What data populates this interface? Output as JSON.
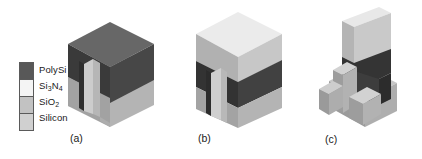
{
  "figure": {
    "background": "#ffffff"
  },
  "legend": {
    "name": "materials-legend",
    "items": [
      {
        "label": "PolySi",
        "color": "#585858",
        "symbol": "PolySi"
      },
      {
        "label": "Si3N4",
        "color": "#f4f4f4",
        "symbol": "Si",
        "sub1": "3",
        "mid": "N",
        "sub2": "4"
      },
      {
        "label": "SiO2",
        "color": "#c2c2c2",
        "symbol": "SiO",
        "sub1": "2"
      },
      {
        "label": "Silicon",
        "color": "#d0d0d0",
        "symbol": "Silicon"
      }
    ]
  },
  "panels": [
    {
      "id": "a",
      "caption": "(a)",
      "description": "PolySi block over silicon substrate with etched trench notch",
      "layers": [
        "Silicon",
        "PolySi"
      ]
    },
    {
      "id": "b",
      "caption": "(b)",
      "description": "Si3N4 / SiO2 cap layer deposited over PolySi and silicon substrate",
      "layers": [
        "Silicon",
        "PolySi",
        "Si3N4"
      ]
    },
    {
      "id": "c",
      "caption": "(c)",
      "description": "Patterned fin with stepped silicon base and pillar after etch",
      "layers": [
        "Silicon",
        "PolySi",
        "Si3N4"
      ]
    }
  ],
  "colors": {
    "polysi_top": "#6a6a6a",
    "polysi_left": "#3c3c3c",
    "polysi_right": "#4a4a4a",
    "polysi_dark": "#303030",
    "silicon_top": "#d4d4d4",
    "silicon_left": "#9a9a9a",
    "silicon_right": "#ababab",
    "silicon_face": "#b5b5b5",
    "nitride_top": "#ececec",
    "nitride_left": "#b0b0b0",
    "nitride_right": "#c6c6c6",
    "trench_fill": "#cfcfcf",
    "trench_side": "#b8b8b8",
    "outline": "#2b2b2b",
    "text": "#1a1a1a"
  }
}
